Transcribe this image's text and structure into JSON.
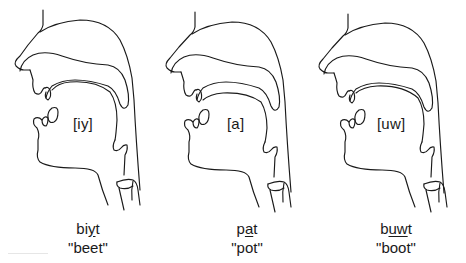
{
  "diagram": {
    "type": "vocal-tract-sagittal-sections",
    "stroke_color": "#1a1a1a",
    "background": "#ffffff",
    "figures": [
      {
        "vowel": "[iy]",
        "transcription": {
          "before": "bi",
          "underlined": "y",
          "after": "t"
        },
        "gloss": "\"beet\""
      },
      {
        "vowel": "[a]",
        "transcription": {
          "before": "p",
          "underlined": "a",
          "after": "t"
        },
        "gloss": "\"pot\""
      },
      {
        "vowel": "[uw]",
        "transcription": {
          "before": "b",
          "underlined": "uw",
          "after": "t"
        },
        "gloss": "\"boot\""
      }
    ]
  }
}
